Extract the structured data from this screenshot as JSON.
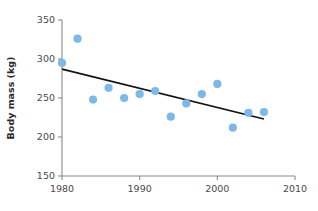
{
  "chart_data": {
    "type": "scatter",
    "title": "",
    "xlabel": "",
    "ylabel": "Body mass (kg)",
    "xlim": [
      1980,
      2010
    ],
    "ylim": [
      150,
      350
    ],
    "xticks": [
      1980,
      1990,
      2000,
      2010
    ],
    "yticks": [
      150,
      200,
      250,
      300,
      350
    ],
    "xtick_labels": [
      "1980",
      "1990",
      "2000",
      "2010"
    ],
    "ytick_labels": [
      "150",
      "200",
      "250",
      "300",
      "350"
    ],
    "grid": false,
    "legend": "none",
    "marker_color": "#7cb9e8",
    "trendline_color": "#121212",
    "axis_color": "#8a8a8a",
    "points": [
      {
        "x": 1980,
        "y": 295
      },
      {
        "x": 1982,
        "y": 326
      },
      {
        "x": 1984,
        "y": 248
      },
      {
        "x": 1986,
        "y": 263
      },
      {
        "x": 1988,
        "y": 250
      },
      {
        "x": 1990,
        "y": 255
      },
      {
        "x": 1992,
        "y": 259
      },
      {
        "x": 1994,
        "y": 226
      },
      {
        "x": 1996,
        "y": 243
      },
      {
        "x": 1998,
        "y": 255
      },
      {
        "x": 2000,
        "y": 268
      },
      {
        "x": 2002,
        "y": 212
      },
      {
        "x": 2004,
        "y": 231
      },
      {
        "x": 2006,
        "y": 232
      }
    ],
    "trendline": {
      "x_start": 1980,
      "y_start": 287,
      "x_end": 2006,
      "y_end": 223
    }
  }
}
